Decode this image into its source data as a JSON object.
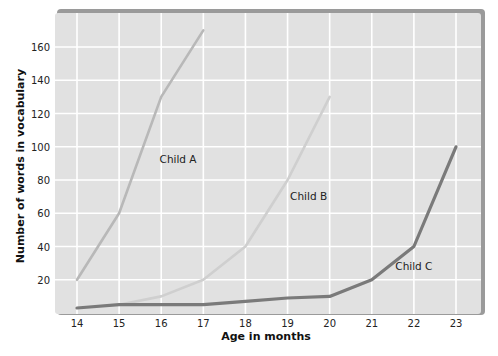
{
  "chart_data": {
    "type": "line",
    "title": "",
    "xlabel": "Age in months",
    "ylabel": "Number of words in vocabulary",
    "x": [
      14,
      15,
      16,
      17,
      18,
      19,
      20,
      21,
      22,
      23
    ],
    "x_tick_labels": [
      "14",
      "15",
      "16",
      "17",
      "18",
      "19",
      "20",
      "21",
      "22",
      "23"
    ],
    "y_tick_labels": [
      "20",
      "40",
      "60",
      "80",
      "100",
      "120",
      "140",
      "160"
    ],
    "y_ticks": [
      20,
      40,
      60,
      80,
      100,
      120,
      140,
      160
    ],
    "xlim": [
      13.5,
      23.6
    ],
    "ylim": [
      0,
      180
    ],
    "grid": true,
    "legend": "inline labels",
    "series": [
      {
        "name": "Child A",
        "color": "#b8b8b8",
        "points": [
          [
            14,
            20
          ],
          [
            15,
            60
          ],
          [
            16,
            130
          ],
          [
            17,
            170
          ]
        ],
        "label_pos": [
          16.4,
          90
        ]
      },
      {
        "name": "Child B",
        "color": "#cfcfcf",
        "points": [
          [
            15,
            5
          ],
          [
            16,
            10
          ],
          [
            17,
            20
          ],
          [
            18,
            40
          ],
          [
            19,
            80
          ],
          [
            20,
            130
          ]
        ],
        "label_pos": [
          19.5,
          68
        ]
      },
      {
        "name": "Child C",
        "color": "#7a7a7a",
        "points": [
          [
            14,
            3
          ],
          [
            15,
            5
          ],
          [
            16,
            5
          ],
          [
            17,
            5
          ],
          [
            18,
            7
          ],
          [
            19,
            9
          ],
          [
            20,
            10
          ],
          [
            21,
            20
          ],
          [
            22,
            40
          ],
          [
            23,
            100
          ]
        ],
        "label_pos": [
          22.0,
          26
        ]
      }
    ]
  },
  "colors": {
    "panel_bg": "#e1e1e1",
    "grid": "#ffffff",
    "panel_border": "#9a9a9a"
  }
}
